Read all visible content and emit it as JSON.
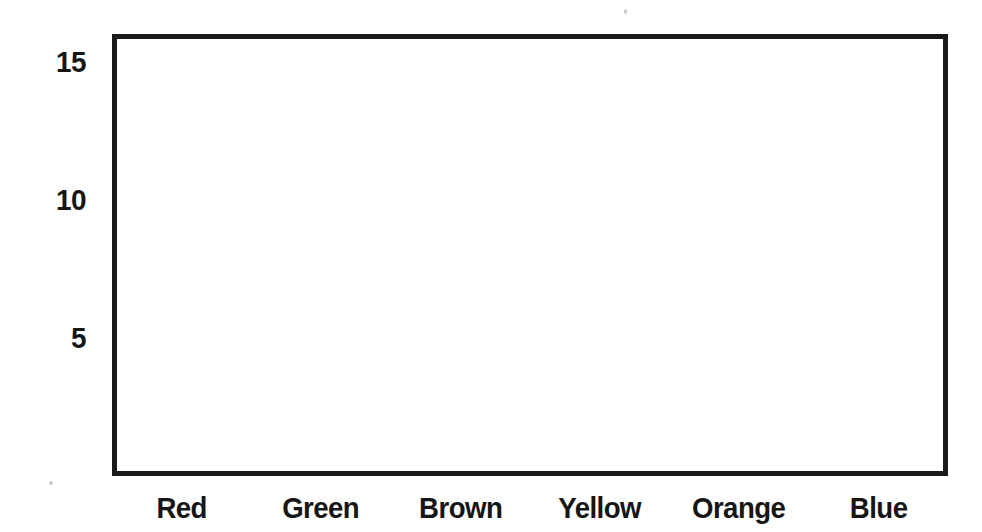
{
  "chart_data": {
    "type": "bar",
    "title": "",
    "subtitle": "",
    "xlabel": "",
    "ylabel": "",
    "categories": [
      "Red",
      "Green",
      "Brown",
      "Yellow",
      "Orange",
      "Blue"
    ],
    "values": [
      null,
      null,
      null,
      null,
      null,
      null
    ],
    "series": [
      {
        "name": "",
        "values": [
          null,
          null,
          null,
          null,
          null,
          null
        ]
      }
    ],
    "ytick_labels": [
      "15",
      "10",
      "5"
    ],
    "ytick_values": [
      15,
      10,
      5
    ],
    "ylim": [
      0,
      16
    ],
    "xlim": [
      0,
      6
    ],
    "grid": false,
    "legend": null,
    "legend_position": "none",
    "annotations": []
  },
  "axes": {
    "frame_color": "#1a1a1a",
    "frame_border_width_px": 5,
    "plot_background": "#ffffff",
    "y_ticks": [
      {
        "label": "15",
        "value": 15
      },
      {
        "label": "10",
        "value": 10
      },
      {
        "label": "5",
        "value": 5
      }
    ],
    "x_ticks": [
      {
        "label": "Red"
      },
      {
        "label": "Green"
      },
      {
        "label": "Brown"
      },
      {
        "label": "Yellow"
      },
      {
        "label": "Orange"
      },
      {
        "label": "Blue"
      }
    ]
  },
  "page": {
    "background": "#ffffff",
    "text_color": "#161616"
  }
}
